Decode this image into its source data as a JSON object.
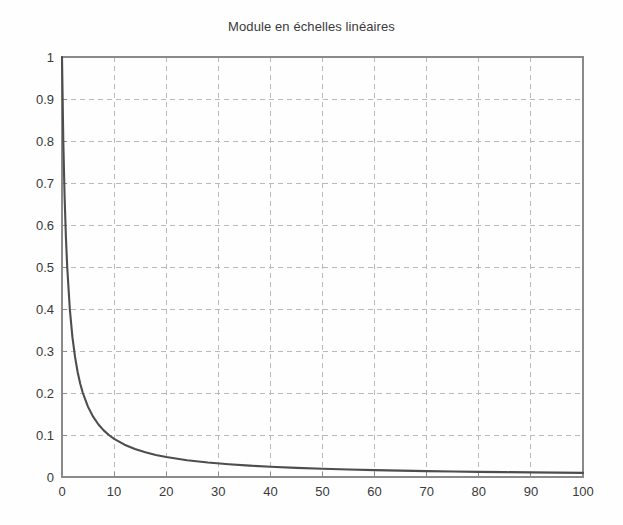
{
  "figure": {
    "background_color": "#fefefe",
    "axes_color": "#8a8a8a",
    "grid_color": "#b9b9b9",
    "curve_color": "#4d4d4d",
    "text_color": "#3a3a3a"
  },
  "chart_data": {
    "type": "line",
    "title": "Module en échelles linéaires",
    "xlabel": "",
    "ylabel": "",
    "xlim": [
      0,
      100
    ],
    "ylim": [
      0,
      1
    ],
    "grid": true,
    "legend": "none",
    "x_ticks": [
      0,
      10,
      20,
      30,
      40,
      50,
      60,
      70,
      80,
      90,
      100
    ],
    "x_tick_labels": [
      "0",
      "10",
      "20",
      "30",
      "40",
      "50",
      "60",
      "70",
      "80",
      "90",
      "100"
    ],
    "y_ticks": [
      0,
      0.1,
      0.2,
      0.3,
      0.4,
      0.5,
      0.6,
      0.7,
      0.8,
      0.9,
      1
    ],
    "y_tick_labels": [
      "0",
      "0.1",
      "0.2",
      "0.3",
      "0.4",
      "0.5",
      "0.6",
      "0.7",
      "0.8",
      "0.9",
      "1"
    ],
    "series": [
      {
        "name": "module",
        "x": [
          0,
          0.25,
          0.5,
          0.75,
          1,
          1.5,
          2,
          2.5,
          3,
          3.5,
          4,
          5,
          6,
          7,
          8,
          9,
          10,
          12,
          14,
          16,
          18,
          20,
          24,
          28,
          32,
          36,
          40,
          45,
          50,
          55,
          60,
          65,
          70,
          75,
          80,
          85,
          90,
          95,
          100
        ],
        "y": [
          1,
          0.8,
          0.667,
          0.571,
          0.5,
          0.4,
          0.333,
          0.286,
          0.25,
          0.222,
          0.2,
          0.167,
          0.143,
          0.125,
          0.111,
          0.1,
          0.0909,
          0.0769,
          0.0667,
          0.0588,
          0.0526,
          0.0476,
          0.04,
          0.0345,
          0.0303,
          0.027,
          0.0244,
          0.0217,
          0.0196,
          0.0179,
          0.0164,
          0.0152,
          0.0141,
          0.0132,
          0.0123,
          0.0116,
          0.011,
          0.0104,
          0.0099
        ]
      }
    ],
    "annotations": []
  }
}
